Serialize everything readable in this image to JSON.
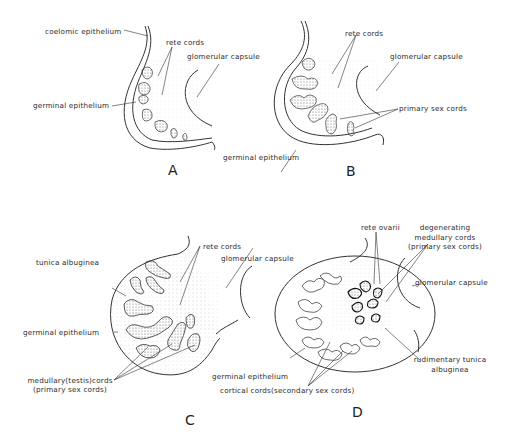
{
  "panels": [
    {
      "letter": "A",
      "labels": {
        "coelomic": "coelomic epithelium",
        "rete": "rete cords",
        "glomerular": "glomerular capsule",
        "germinal": "germinal epithelium"
      }
    },
    {
      "letter": "B",
      "labels": {
        "rete": "rete cords",
        "glomerular": "glomerular capsule",
        "primary": "primary sex cords",
        "germinal": "germinal epithelium"
      }
    },
    {
      "letter": "C",
      "labels": {
        "tunica": "tunica albuginea",
        "rete": "rete cords",
        "glomerular": "glomerular capsule",
        "germinal": "germinal epithelium",
        "medullary1": "medullary(testis)cords",
        "medullary2": "(primary sex cords)"
      }
    },
    {
      "letter": "D",
      "labels": {
        "rete_ovarii": "rete ovarii",
        "degen1": "degenerating",
        "degen2": "medullary cords",
        "degen3": "(primary sex cords)",
        "glomerular": "glomerular capsule",
        "germinal": "germinal epithelium",
        "cortical": "cortical cords(secondary sex cords)",
        "rudim1": "rudimentary tunica",
        "rudim2": "albuginea"
      }
    }
  ]
}
